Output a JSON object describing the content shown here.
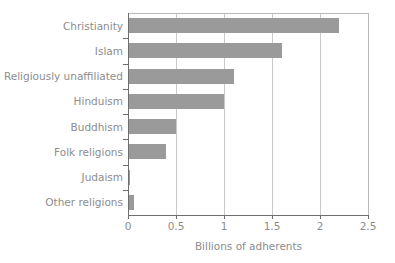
{
  "chart_data": {
    "type": "bar",
    "orientation": "horizontal",
    "title": "",
    "xlabel": "Billions of adherents",
    "ylabel": "",
    "categories": [
      "Christianity",
      "Islam",
      "Religiously unaffiliated",
      "Hinduism",
      "Buddhism",
      "Folk religions",
      "Judaism",
      "Other religions"
    ],
    "values": [
      2.2,
      1.6,
      1.1,
      1.0,
      0.5,
      0.4,
      0.02,
      0.06
    ],
    "xlim": [
      0,
      2.5
    ],
    "xticks": [
      0,
      0.5,
      1,
      1.5,
      2,
      2.5
    ],
    "xtick_labels": [
      "0",
      "0.5",
      "1",
      "1.5",
      "2",
      "2.5"
    ],
    "grid": "vertical",
    "legend": "none",
    "bar_color": "#9a9a9a",
    "text_color": "#8d8d8d",
    "axis_color": "#6e6e6e",
    "grid_color": "#c9c9c9",
    "background": "#ffffff"
  }
}
